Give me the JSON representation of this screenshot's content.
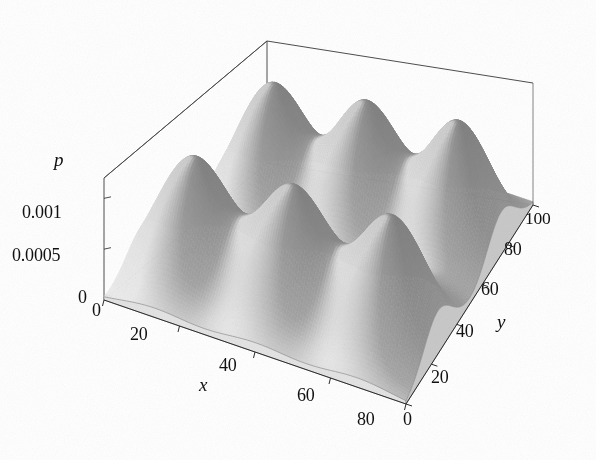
{
  "chart_data": {
    "type": "surface",
    "title": "",
    "xlabel": "x",
    "ylabel": "y",
    "zlabel": "p",
    "xlim": [
      0,
      80
    ],
    "ylim": [
      0,
      100
    ],
    "zlim": [
      0,
      0.0012
    ],
    "xticks": [
      "0",
      "20",
      "40",
      "60",
      "80"
    ],
    "xtick_values": [
      0,
      20,
      40,
      60,
      80
    ],
    "yticks": [
      "0",
      "20",
      "40",
      "60",
      "80",
      "100"
    ],
    "ytick_values": [
      0,
      20,
      40,
      60,
      80,
      100
    ],
    "zticks": [
      "0",
      "0.0005",
      "0.001"
    ],
    "ztick_values": [
      0,
      0.0005,
      0.001
    ],
    "grid": false,
    "legend": "none",
    "colormap": "grayscale",
    "projection": "3d-box",
    "peaks": [
      {
        "x": 13,
        "y": 25,
        "amplitude": 0.0012,
        "sigma_x": 9,
        "sigma_y": 11
      },
      {
        "x": 40,
        "y": 25,
        "amplitude": 0.0012,
        "sigma_x": 9,
        "sigma_y": 11
      },
      {
        "x": 67,
        "y": 25,
        "amplitude": 0.0012,
        "sigma_x": 9,
        "sigma_y": 11
      },
      {
        "x": 13,
        "y": 75,
        "amplitude": 0.0012,
        "sigma_x": 9,
        "sigma_y": 11
      },
      {
        "x": 40,
        "y": 75,
        "amplitude": 0.0012,
        "sigma_x": 9,
        "sigma_y": 11
      },
      {
        "x": 67,
        "y": 75,
        "amplitude": 0.0012,
        "sigma_x": 9,
        "sigma_y": 11
      }
    ],
    "surface_colors": {
      "peak_top": "#9c9c9c",
      "lit_flank": "#f2f2f2",
      "shadow_flank": "#7d7d7d",
      "base": "#d8d8d8",
      "edge_line": "#3a3a3a",
      "background": "#ffffff"
    }
  },
  "axes": {
    "z": {
      "label": "p",
      "ticks": [
        {
          "text": "0.001",
          "left": 22,
          "top": 203
        },
        {
          "text": "0.0005",
          "left": 12,
          "top": 246
        },
        {
          "text": "0",
          "left": 78,
          "top": 288
        }
      ],
      "label_pos": {
        "left": 54,
        "top": 150
      }
    },
    "x": {
      "label": "x",
      "ticks": [
        {
          "text": "0",
          "left": 92,
          "top": 301
        },
        {
          "text": "20",
          "left": 130,
          "top": 325
        },
        {
          "text": "40",
          "left": 219,
          "top": 356
        },
        {
          "text": "60",
          "left": 297,
          "top": 386
        },
        {
          "text": "80",
          "left": 357,
          "top": 410
        }
      ],
      "label_pos": {
        "left": 199,
        "top": 375
      }
    },
    "y": {
      "label": "y",
      "ticks": [
        {
          "text": "0",
          "left": 403,
          "top": 410
        },
        {
          "text": "20",
          "left": 431,
          "top": 368
        },
        {
          "text": "40",
          "left": 456,
          "top": 322
        },
        {
          "text": "60",
          "left": 481,
          "top": 280
        },
        {
          "text": "80",
          "left": 504,
          "top": 240
        },
        {
          "text": "100",
          "left": 525,
          "top": 210
        }
      ],
      "label_pos": {
        "left": 497,
        "top": 312
      }
    }
  }
}
